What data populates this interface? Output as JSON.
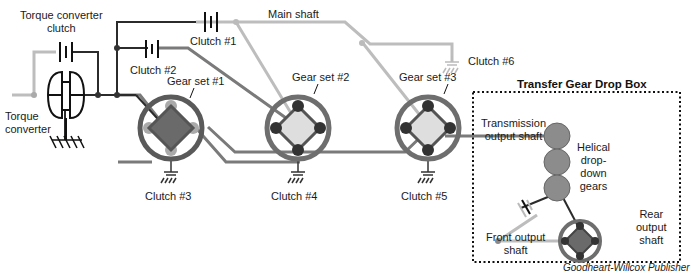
{
  "diagram": {
    "labels": {
      "torque_converter_clutch": "Torque converter\nclutch",
      "torque_converter": "Torque\nconverter",
      "main_shaft": "Main shaft",
      "clutch1": "Clutch #1",
      "clutch2": "Clutch #2",
      "clutch3": "Clutch #3",
      "clutch4": "Clutch #4",
      "clutch5": "Clutch #5",
      "clutch6": "Clutch #6",
      "gear_set1": "Gear set #1",
      "gear_set2": "Gear set #2",
      "gear_set3": "Gear set #3",
      "transfer_box_title": "Transfer Gear Drop Box",
      "transmission_output_shaft": "Transmission\noutput shaft",
      "helical_gears": "Helical\ndrop-\ndown\ngears",
      "front_output_shaft": "Front output\nshaft",
      "rear_output_shaft": "Rear\noutput\nshaft"
    },
    "credit": "Goodheart-Willcox Publisher",
    "colors": {
      "dark_line": "#333333",
      "medium_line": "#777777",
      "light_line": "#bbbbbb",
      "gear_ring": "#6e6e6e",
      "carrier_dark": "#6a6a6a",
      "carrier_light": "#dcdcdc",
      "drop_gear": "#8c8c8c"
    }
  }
}
